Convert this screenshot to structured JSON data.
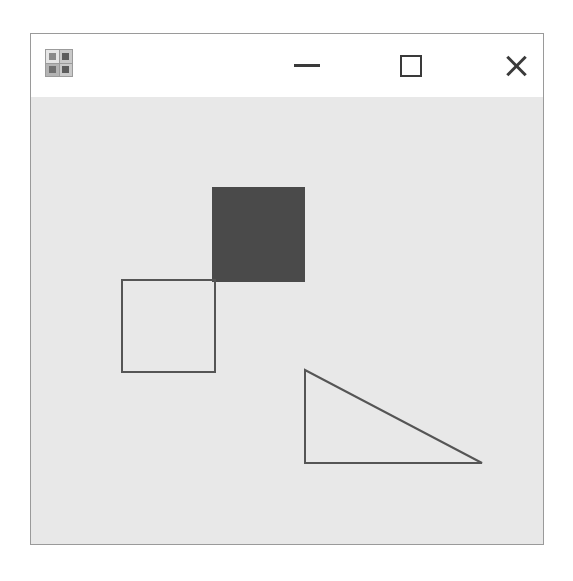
{
  "window": {
    "title": "",
    "icon_name": "app-icon",
    "background": "#ffffff",
    "border_color": "#9a9a9a",
    "titlebar_background": "#ffffff"
  },
  "titlebar": {
    "minimize_label": "—",
    "maximize_label": "□",
    "close_label": "✕",
    "minimize_name": "minimize-icon",
    "maximize_name": "maximize-icon",
    "close_name": "close-icon",
    "glyph_color": "#3a3a3a"
  },
  "canvas": {
    "background": "#e8e8e8",
    "width": 512,
    "height": 447,
    "outline_color": "#555555",
    "fill_color": "#4a4a4a",
    "stroke_width": 2,
    "shapes": [
      {
        "name": "filled-square",
        "type": "rect",
        "x": 181,
        "y": 90,
        "width": 93,
        "height": 95,
        "fill": "#4a4a4a",
        "stroke": "none"
      },
      {
        "name": "outlined-square",
        "type": "rect",
        "x": 91,
        "y": 183,
        "width": 93,
        "height": 92,
        "fill": "none",
        "stroke": "#555555"
      },
      {
        "name": "outlined-triangle",
        "type": "polygon",
        "points": "274,273 274,366 451,366",
        "fill": "none",
        "stroke": "#555555"
      }
    ]
  }
}
